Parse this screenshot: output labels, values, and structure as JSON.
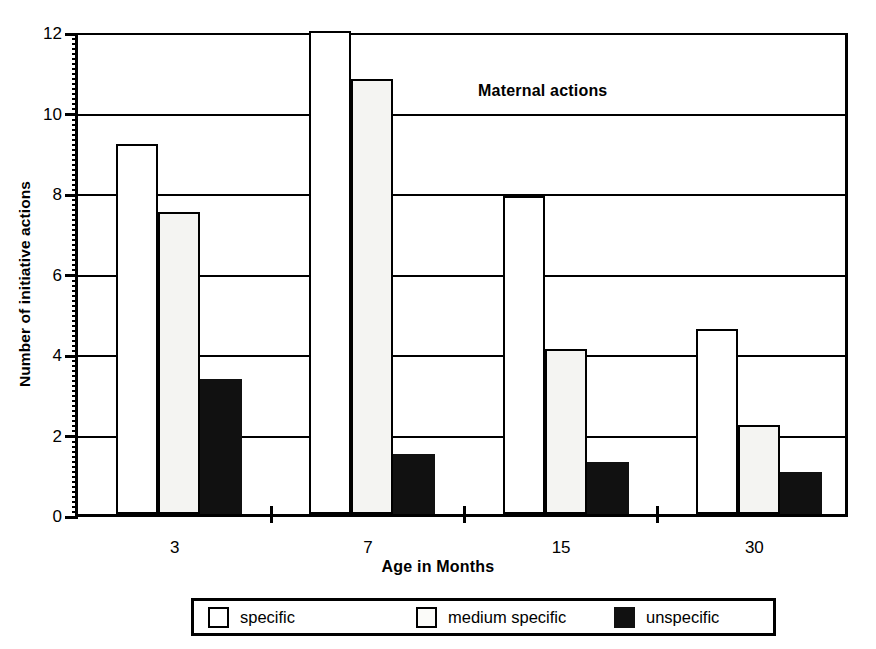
{
  "chart_data": {
    "type": "bar",
    "title": "Maternal actions",
    "xlabel": "Age in Months",
    "ylabel": "Number of initiative actions",
    "categories": [
      "3",
      "7",
      "15",
      "30"
    ],
    "series": [
      {
        "name": "specific",
        "values": [
          9.2,
          12.0,
          7.9,
          4.6
        ]
      },
      {
        "name": "medium specific",
        "values": [
          7.5,
          10.8,
          4.1,
          2.2
        ]
      },
      {
        "name": "unspecific",
        "values": [
          3.35,
          1.5,
          1.3,
          1.05
        ]
      }
    ],
    "ylim": [
      0,
      12
    ],
    "yticks": [
      "0",
      "2",
      "4",
      "6",
      "8",
      "10",
      "12"
    ],
    "grid": true,
    "legend_position": "bottom",
    "colors": {
      "specific": "#ffffff",
      "medium specific": "#f4f4f2",
      "unspecific": "#111111",
      "outline": "#000000",
      "background": "#ffffff"
    }
  },
  "legend": {
    "items": [
      {
        "label": "specific",
        "swatch": "white"
      },
      {
        "label": "medium specific",
        "swatch": "offwhite"
      },
      {
        "label": "unspecific",
        "swatch": "black"
      }
    ]
  }
}
